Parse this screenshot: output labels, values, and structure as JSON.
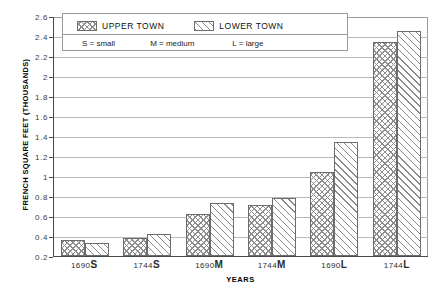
{
  "chart_data": {
    "type": "bar",
    "title": "",
    "categories": [
      "1690S",
      "1744S",
      "1690M",
      "1744M",
      "1690L",
      "1744L"
    ],
    "series": [
      {
        "name": "UPPER TOWN",
        "values": [
          0.36,
          0.38,
          0.62,
          0.71,
          1.04,
          2.34
        ]
      },
      {
        "name": "LOWER TOWN",
        "values": [
          0.33,
          0.42,
          0.73,
          0.78,
          1.34,
          2.45
        ]
      }
    ],
    "xlabel": "YEARS",
    "ylabel": "FRENCH SQUARE FEET (THOUSANDS)",
    "ylim": [
      0.2,
      2.6
    ],
    "ytick_step": 0.2,
    "yticks": [
      "2.6",
      "2.4",
      "2.2",
      "2",
      "1.8",
      "1.6",
      "1.4",
      "1.2",
      "1",
      "0.8",
      "0.6",
      "0.4",
      "0.2"
    ],
    "grid": true,
    "legend_position": "top-left-inside",
    "annotations": [
      "S = small",
      "M = medium",
      "L = large"
    ]
  },
  "legend": {
    "upper_label": "UPPER TOWN",
    "lower_label": "LOWER TOWN",
    "note_small": "S = small",
    "note_medium": "M = medium",
    "note_large": "L = large"
  },
  "axes": {
    "y_title": "FRENCH SQUARE FEET (THOUSANDS)",
    "x_title": "YEARS"
  },
  "xlabels": [
    {
      "year": "1690",
      "size": "S"
    },
    {
      "year": "1744",
      "size": "S"
    },
    {
      "year": "1690",
      "size": "M"
    },
    {
      "year": "1744",
      "size": "M"
    },
    {
      "year": "1690",
      "size": "L"
    },
    {
      "year": "1744",
      "size": "L"
    }
  ]
}
